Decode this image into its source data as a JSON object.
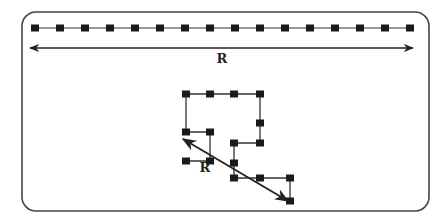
{
  "diagram": {
    "frame": {
      "x": 22,
      "y": 12,
      "width": 407,
      "height": 199,
      "radius": 14,
      "stroke": "#444444"
    },
    "colors": {
      "node": "#1a1a1a",
      "link": "#333333",
      "arrow": "#222222"
    },
    "extended_chain": {
      "y": 28,
      "x_start": 35,
      "spacing": 25,
      "node_count": 16
    },
    "extended_arrow": {
      "x1": 30,
      "x2": 413,
      "y": 48,
      "label": "R",
      "label_x": 222,
      "label_y": 63
    },
    "coil_chain": {
      "nodes": [
        [
          186,
          161
        ],
        [
          210,
          161
        ],
        [
          210,
          132
        ],
        [
          186,
          132
        ],
        [
          186,
          94
        ],
        [
          210,
          94
        ],
        [
          234,
          94
        ],
        [
          260,
          94
        ],
        [
          260,
          123
        ],
        [
          260,
          143
        ],
        [
          234,
          143
        ],
        [
          234,
          163
        ],
        [
          234,
          178
        ],
        [
          260,
          178
        ],
        [
          290,
          178
        ],
        [
          290,
          201
        ]
      ]
    },
    "coil_arrow": {
      "x1": 183,
      "y1": 139,
      "x2": 288,
      "y2": 201,
      "label": "R",
      "label_x": 205,
      "label_y": 172
    }
  }
}
